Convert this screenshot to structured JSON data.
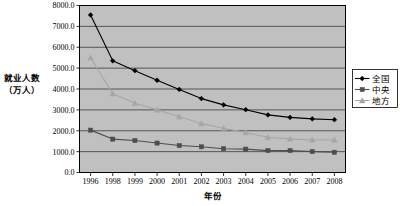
{
  "chart_data": {
    "type": "line",
    "title": "",
    "xlabel": "年份",
    "ylabel": "就业人数\n（万人）",
    "ylabel_line1": "就业人数",
    "ylabel_line2": "（万人）",
    "categories": [
      "1996",
      "1998",
      "1999",
      "2000",
      "2001",
      "2002",
      "2003",
      "2004",
      "2005",
      "2006",
      "2007",
      "2008"
    ],
    "ylim": [
      0,
      8000
    ],
    "ystep": 1000,
    "ytick_labels": [
      "0.0",
      "1000.0",
      "2000.0",
      "3000.0",
      "4000.0",
      "5000.0",
      "6000.0",
      "7000.0",
      "8000.0"
    ],
    "ytick_values": [
      0,
      1000,
      2000,
      3000,
      4000,
      5000,
      6000,
      7000,
      8000
    ],
    "grid": true,
    "grid_axis": "y",
    "legend_position": "right",
    "plot_bgcolor": "#c0c0c0",
    "series": [
      {
        "name": "全国",
        "marker": "diamond",
        "color": "#000000",
        "values": [
          7550,
          5350,
          4880,
          4420,
          3980,
          3540,
          3240,
          3010,
          2760,
          2640,
          2570,
          2530
        ]
      },
      {
        "name": "中央",
        "marker": "square",
        "color": "#4d4d4d",
        "values": [
          2030,
          1600,
          1530,
          1410,
          1290,
          1230,
          1140,
          1120,
          1050,
          1050,
          1000,
          970
        ]
      },
      {
        "name": "地方",
        "marker": "triangle",
        "color": "#a6a6a6",
        "values": [
          5500,
          3780,
          3320,
          3000,
          2680,
          2340,
          2120,
          1910,
          1690,
          1610,
          1560,
          1570
        ]
      }
    ]
  }
}
